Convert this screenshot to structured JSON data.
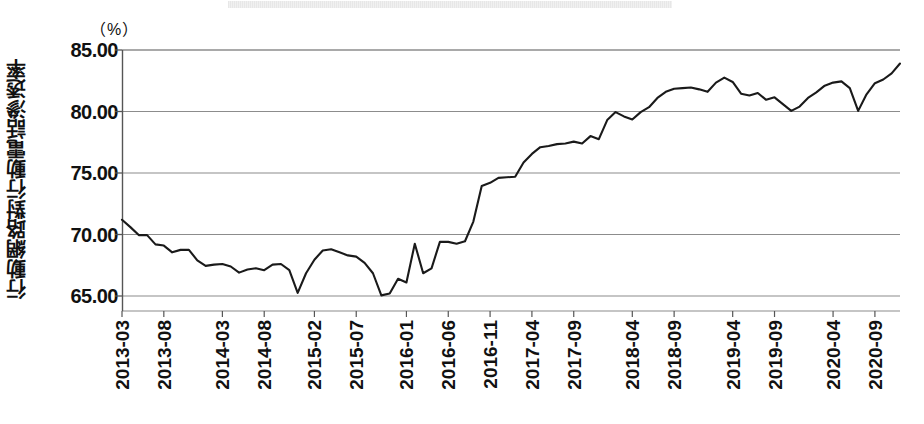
{
  "figure": {
    "unit_label": "（%）",
    "y_axis_caption": "行動網路對行動電話滲透率",
    "title_band_present": true
  },
  "chart_data": {
    "type": "line",
    "title": "",
    "subtitle": "",
    "xlabel": "",
    "ylabel": "行動網路對行動電話滲透率",
    "unit": "%",
    "ylim": [
      65.0,
      85.0
    ],
    "yticks": [
      65.0,
      70.0,
      75.0,
      80.0,
      85.0
    ],
    "ytick_labels": [
      "65.00",
      "70.00",
      "75.00",
      "80.00",
      "85.00"
    ],
    "grid": true,
    "legend": "none",
    "line_color": "#1a1a1a",
    "grid_color": "#8c8c8c",
    "xtick_labels": [
      "2013-03",
      "2013-08",
      "2014-03",
      "2014-08",
      "2015-02",
      "2015-07",
      "2016-01",
      "2016-06",
      "2016-11",
      "2017-04",
      "2017-09",
      "2018-04",
      "2018-09",
      "2019-04",
      "2019-09",
      "2020-04",
      "2020-09"
    ],
    "xtick_indices": [
      0,
      5,
      12,
      17,
      23,
      28,
      34,
      39,
      44,
      49,
      54,
      61,
      66,
      73,
      78,
      85,
      90
    ],
    "x": [
      "2013-03",
      "2013-04",
      "2013-05",
      "2013-06",
      "2013-07",
      "2013-08",
      "2013-09",
      "2013-10",
      "2013-11",
      "2013-12",
      "2014-01",
      "2014-02",
      "2014-03",
      "2014-04",
      "2014-05",
      "2014-06",
      "2014-07",
      "2014-08",
      "2014-09",
      "2014-10",
      "2014-11",
      "2014-12",
      "2015-01",
      "2015-02",
      "2015-03",
      "2015-04",
      "2015-05",
      "2015-06",
      "2015-07",
      "2015-08",
      "2015-09",
      "2015-10",
      "2015-11",
      "2015-12",
      "2016-01",
      "2016-02",
      "2016-03",
      "2016-04",
      "2016-05",
      "2016-06",
      "2016-07",
      "2016-08",
      "2016-09",
      "2016-10",
      "2016-11",
      "2016-12",
      "2017-01",
      "2017-02",
      "2017-03",
      "2017-04",
      "2017-05",
      "2017-06",
      "2017-07",
      "2017-08",
      "2017-09",
      "2017-10",
      "2017-11",
      "2017-12",
      "2018-01",
      "2018-02",
      "2018-03",
      "2018-04",
      "2018-05",
      "2018-06",
      "2018-07",
      "2018-08",
      "2018-09",
      "2018-10",
      "2018-11",
      "2018-12",
      "2019-01",
      "2019-02",
      "2019-03",
      "2019-04",
      "2019-05",
      "2019-06",
      "2019-07",
      "2019-08",
      "2019-09",
      "2019-10",
      "2019-11",
      "2019-12",
      "2020-01",
      "2020-02",
      "2020-03",
      "2020-04",
      "2020-05",
      "2020-06",
      "2020-07",
      "2020-08",
      "2020-09",
      "2020-10",
      "2020-11",
      "2020-12"
    ],
    "values": [
      71.2,
      70.6,
      69.95,
      69.95,
      69.2,
      69.1,
      68.55,
      68.75,
      68.75,
      67.9,
      67.45,
      67.55,
      67.6,
      67.4,
      66.9,
      67.15,
      67.25,
      67.1,
      67.55,
      67.6,
      67.1,
      65.25,
      66.85,
      67.95,
      68.7,
      68.8,
      68.55,
      68.3,
      68.2,
      67.7,
      66.85,
      65.05,
      65.2,
      66.4,
      66.1,
      69.25,
      66.85,
      67.25,
      69.4,
      69.4,
      69.25,
      69.45,
      71.05,
      73.95,
      74.2,
      74.6,
      74.65,
      74.7,
      75.85,
      76.55,
      77.1,
      77.2,
      77.35,
      77.4,
      77.55,
      77.4,
      78.0,
      77.75,
      79.3,
      79.95,
      79.6,
      79.35,
      79.95,
      80.35,
      81.1,
      81.6,
      81.85,
      81.9,
      81.95,
      81.8,
      81.6,
      82.35,
      82.75,
      82.4,
      81.45,
      81.3,
      81.5,
      80.95,
      81.15,
      80.6,
      80.05,
      80.4,
      81.1,
      81.55,
      82.1,
      82.35,
      82.45,
      81.9,
      80.05,
      81.4,
      82.3,
      82.6,
      83.1,
      83.9
    ]
  }
}
